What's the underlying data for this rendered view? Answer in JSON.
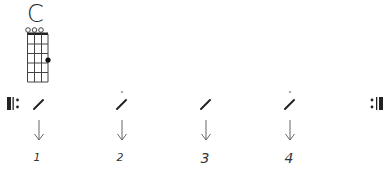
{
  "chord": {
    "name": "C",
    "strings": 4,
    "frets": 5,
    "open_strings": [
      1,
      2,
      3
    ],
    "fingered": [
      {
        "string": 4,
        "fret": 3
      }
    ]
  },
  "pattern": {
    "repeat_start": true,
    "repeat_end": true,
    "beats": [
      {
        "number": "1",
        "stroke": "down",
        "accent_dot": false,
        "x": 39
      },
      {
        "number": "2",
        "stroke": "down",
        "accent_dot": true,
        "x": 122
      },
      {
        "number": "3",
        "stroke": "down",
        "accent_dot": false,
        "x": 205
      },
      {
        "number": "4",
        "stroke": "down",
        "accent_dot": true,
        "x": 290
      }
    ]
  },
  "colors": {
    "ink": "#222222",
    "arrow": "#666666",
    "grid": "#444444"
  }
}
